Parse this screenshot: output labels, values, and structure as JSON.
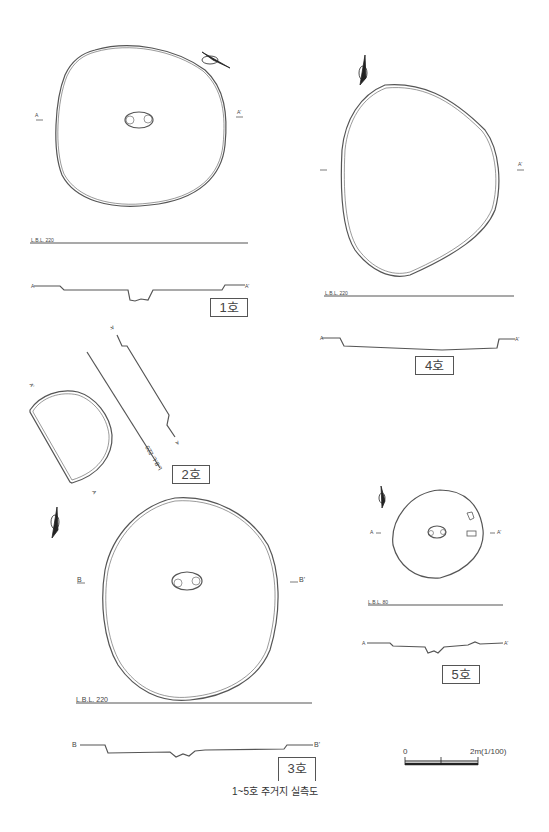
{
  "figure": {
    "caption": "1~5호 주거지 실측도",
    "scale": {
      "zero": "0",
      "end": "2m(1/100)"
    }
  },
  "houses": [
    {
      "label": "1호",
      "lbl": "L.B.L. 220",
      "section_start": "A",
      "section_end": "A'"
    },
    {
      "label": "2호",
      "lbl": "L.B.L. 220",
      "section_start": "A",
      "section_end": "A'"
    },
    {
      "label": "3호",
      "lbl": "L.B.L. 220",
      "section_start": "B",
      "section_end": "B'"
    },
    {
      "label": "4호",
      "lbl": "L.B.L. 220",
      "section_start": "A",
      "section_end": "A'"
    },
    {
      "label": "5호",
      "lbl": "L.B.L. 80",
      "section_start": "A",
      "section_end": "A'"
    }
  ],
  "colors": {
    "line": "#555555",
    "background": "#ffffff",
    "arrow": "#222222"
  }
}
